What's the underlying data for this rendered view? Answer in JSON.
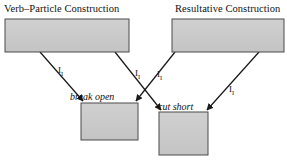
{
  "figure": {
    "type": "inheritance-hierarchy-diagram",
    "background_color": "#ffffff",
    "box_fill_color": "#c9c9c9",
    "box_border_color": "#4a4a4a",
    "line_color": "#1a1a1a"
  },
  "headings": {
    "left": "Verb–Particle Construction",
    "right": "Resultative Construction"
  },
  "nodes": [
    {
      "id": "verb-particle-construction-box",
      "label": "",
      "x": 5,
      "y": 19,
      "width": 124,
      "height": 33
    },
    {
      "id": "resultative-construction-box",
      "label": "",
      "x": 172,
      "y": 19,
      "width": 112,
      "height": 33
    },
    {
      "id": "break-open-box",
      "label": "",
      "x": 81,
      "y": 103,
      "width": 57,
      "height": 37
    },
    {
      "id": "cut-short-box",
      "label": "",
      "x": 159,
      "y": 112,
      "width": 49,
      "height": 43
    }
  ],
  "instance_labels": [
    {
      "id": "break-open-label",
      "text": "break open",
      "x": 70,
      "y": 100
    },
    {
      "id": "cut-short-label",
      "text": "cut short",
      "x": 158,
      "y": 110
    }
  ],
  "edges": [
    {
      "id": "edge-vpc-to-break-open",
      "from": "verb-particle-construction-box",
      "to": "break-open-box",
      "label_base": "I",
      "label_sub": "I",
      "label_x": 58,
      "label_y": 73,
      "x1": 40,
      "y1": 52,
      "x2": 83,
      "y2": 101
    },
    {
      "id": "edge-vpc-to-cut-short",
      "from": "verb-particle-construction-box",
      "to": "cut-short-box",
      "label_base": "I",
      "label_sub": "I",
      "label_x": 135,
      "label_y": 76,
      "x1": 115,
      "y1": 52,
      "x2": 161,
      "y2": 110
    },
    {
      "id": "edge-resultative-to-break-open",
      "from": "resultative-construction-box",
      "to": "break-open-box",
      "label_base": "I",
      "label_sub": "I",
      "label_x": 157,
      "label_y": 77,
      "x1": 175,
      "y1": 52,
      "x2": 136,
      "y2": 101
    },
    {
      "id": "edge-resultative-to-cut-short",
      "from": "resultative-construction-box",
      "to": "cut-short-box",
      "label_base": "I",
      "label_sub": "I",
      "label_x": 229,
      "label_y": 92,
      "x1": 259,
      "y1": 52,
      "x2": 207,
      "y2": 110
    }
  ]
}
